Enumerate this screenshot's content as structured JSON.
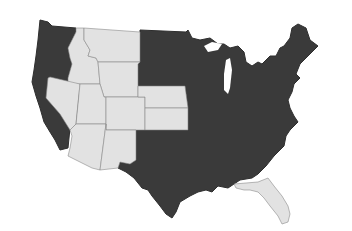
{
  "map": {
    "title": "",
    "region": "contiguous-united-states",
    "colors": {
      "highlight_dark": "#3a3a3a",
      "highlight_light": "#e2e2e2",
      "border": "#8a8a8a",
      "background": "#ffffff"
    },
    "light_states": [
      "Montana",
      "Idaho",
      "Wyoming",
      "Nevada",
      "Utah",
      "Colorado",
      "Arizona",
      "New Mexico",
      "Nebraska",
      "Kansas",
      "Florida"
    ],
    "dark_states": [
      "Washington",
      "Oregon",
      "California",
      "North Dakota",
      "South Dakota",
      "Minnesota",
      "Iowa",
      "Missouri",
      "Oklahoma",
      "Texas",
      "Arkansas",
      "Louisiana",
      "Wisconsin",
      "Illinois",
      "Michigan",
      "Indiana",
      "Ohio",
      "Kentucky",
      "Tennessee",
      "Mississippi",
      "Alabama",
      "Georgia",
      "South Carolina",
      "North Carolina",
      "Virginia",
      "West Virginia",
      "Maryland",
      "Delaware",
      "Pennsylvania",
      "New Jersey",
      "New York",
      "Connecticut",
      "Rhode Island",
      "Massachusetts",
      "Vermont",
      "New Hampshire",
      "Maine"
    ]
  }
}
